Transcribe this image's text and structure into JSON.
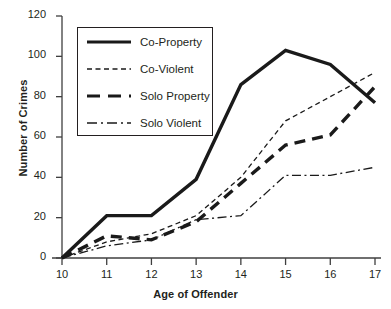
{
  "chart_data": {
    "type": "line",
    "title": "",
    "xlabel": "Age of Offender",
    "ylabel": "Number of Crimes",
    "x": [
      10,
      11,
      12,
      13,
      14,
      15,
      16,
      17
    ],
    "categories": [
      "10",
      "11",
      "12",
      "13",
      "14",
      "15",
      "16",
      "17"
    ],
    "xlim": [
      10,
      17
    ],
    "ylim": [
      0,
      120
    ],
    "ytick_labels": [
      "0",
      "20",
      "40",
      "60",
      "80",
      "100",
      "120"
    ],
    "yticks": [
      0,
      20,
      40,
      60,
      80,
      100,
      120
    ],
    "grid": false,
    "legend_position": "upper left inside",
    "series": [
      {
        "name": "Co-Property",
        "style": "solid-thick",
        "color": "#1a1a1a",
        "values": [
          0,
          21,
          21,
          39,
          86,
          103,
          96,
          77
        ]
      },
      {
        "name": "Co-Violent",
        "style": "dashed-thin",
        "color": "#1a1a1a",
        "values": [
          0,
          8,
          12,
          21,
          40,
          68,
          80,
          92
        ]
      },
      {
        "name": "Solo Property",
        "style": "dashed-thick",
        "color": "#1a1a1a",
        "values": [
          0,
          11,
          9,
          18,
          37,
          56,
          61,
          85
        ]
      },
      {
        "name": "Solo Violent",
        "style": "dashdot-thin",
        "color": "#1a1a1a",
        "values": [
          0,
          6,
          9,
          19,
          21,
          41,
          41,
          45
        ]
      }
    ]
  },
  "axis": {
    "x_title": "Age of Offender",
    "y_title": "Number of Crimes"
  },
  "legend": {
    "items": [
      {
        "label": "Co-Property"
      },
      {
        "label": "Co-Violent"
      },
      {
        "label": "Solo Property"
      },
      {
        "label": "Solo Violent"
      }
    ]
  }
}
